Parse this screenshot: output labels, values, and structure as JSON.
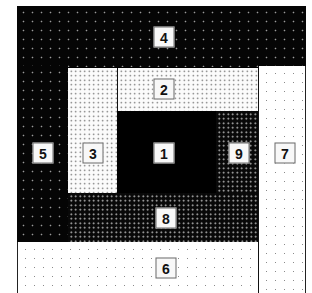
{
  "diagram": {
    "regions": [
      {
        "id": "1",
        "label": "1",
        "fill": "solid black"
      },
      {
        "id": "2",
        "label": "2",
        "fill": "white with dense dark dots"
      },
      {
        "id": "3",
        "label": "3",
        "fill": "white with dense dark dots"
      },
      {
        "id": "4",
        "label": "4",
        "fill": "black with sparse light dots"
      },
      {
        "id": "5",
        "label": "5",
        "fill": "black with sparse light dots"
      },
      {
        "id": "6",
        "label": "6",
        "fill": "white with sparse dots"
      },
      {
        "id": "7",
        "label": "7",
        "fill": "white with sparse dots"
      },
      {
        "id": "8",
        "label": "8",
        "fill": "black with dense light dots"
      },
      {
        "id": "9",
        "label": "9",
        "fill": "black with dense light dots"
      }
    ]
  },
  "colors": {
    "black": "#000000",
    "white": "#ffffff",
    "label_bg": "#f8f8f8",
    "label_border": "#6a6a6a"
  }
}
